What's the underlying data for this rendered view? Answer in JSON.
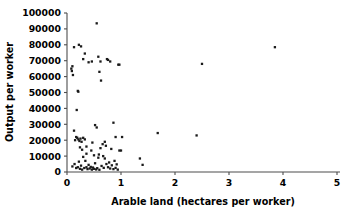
{
  "chart_data": {
    "type": "scatter",
    "title": "",
    "xlabel": "Arable land (hectares per worker)",
    "ylabel": "Output per worker",
    "xlim": [
      0,
      5
    ],
    "ylim": [
      0,
      100000
    ],
    "grid": false,
    "legend": null,
    "xticks": [
      "0",
      "1",
      "2",
      "3",
      "4",
      "5"
    ],
    "xtick_values": [
      0,
      1,
      2,
      3,
      4,
      5
    ],
    "yticks": [
      "0",
      "10000",
      "20000",
      "30000",
      "40000",
      "50000",
      "60000",
      "70000",
      "80000",
      "90000",
      "100000"
    ],
    "ytick_values": [
      0,
      10000,
      20000,
      30000,
      40000,
      50000,
      60000,
      70000,
      80000,
      90000,
      100000
    ],
    "marker": "square",
    "marker_color": "#1a1a1a",
    "points": [
      [
        0.08,
        65000
      ],
      [
        0.09,
        63500
      ],
      [
        0.1,
        66500
      ],
      [
        0.11,
        61000
      ],
      [
        0.13,
        78500
      ],
      [
        0.22,
        80000
      ],
      [
        0.26,
        79000
      ],
      [
        0.2,
        51000
      ],
      [
        0.21,
        50500
      ],
      [
        0.33,
        74500
      ],
      [
        0.4,
        69000
      ],
      [
        0.46,
        69500
      ],
      [
        0.3,
        71000
      ],
      [
        0.55,
        93500
      ],
      [
        0.58,
        72500
      ],
      [
        0.62,
        69500
      ],
      [
        0.6,
        63000
      ],
      [
        0.63,
        57500
      ],
      [
        0.76,
        70500
      ],
      [
        0.8,
        69500
      ],
      [
        0.74,
        71000
      ],
      [
        0.95,
        67500
      ],
      [
        0.97,
        67500
      ],
      [
        0.18,
        39000
      ],
      [
        0.52,
        29500
      ],
      [
        0.55,
        28000
      ],
      [
        0.86,
        31000
      ],
      [
        0.13,
        26000
      ],
      [
        0.17,
        22000
      ],
      [
        0.19,
        21500
      ],
      [
        0.15,
        20000
      ],
      [
        0.21,
        20500
      ],
      [
        0.23,
        19500
      ],
      [
        0.25,
        21000
      ],
      [
        0.27,
        19000
      ],
      [
        0.3,
        21500
      ],
      [
        0.33,
        20500
      ],
      [
        0.36,
        16000
      ],
      [
        0.24,
        15500
      ],
      [
        0.28,
        14000
      ],
      [
        0.45,
        13500
      ],
      [
        0.47,
        18500
      ],
      [
        0.62,
        15000
      ],
      [
        0.66,
        17500
      ],
      [
        0.7,
        19000
      ],
      [
        0.72,
        16500
      ],
      [
        0.82,
        14500
      ],
      [
        0.9,
        22000
      ],
      [
        0.97,
        13500
      ],
      [
        0.1,
        3500
      ],
      [
        0.14,
        5000
      ],
      [
        0.17,
        2500
      ],
      [
        0.2,
        3000
      ],
      [
        0.22,
        6500
      ],
      [
        0.24,
        2000
      ],
      [
        0.26,
        4000
      ],
      [
        0.28,
        1500
      ],
      [
        0.3,
        9500
      ],
      [
        0.32,
        2500
      ],
      [
        0.34,
        7000
      ],
      [
        0.36,
        3000
      ],
      [
        0.38,
        1800
      ],
      [
        0.4,
        4500
      ],
      [
        0.42,
        2200
      ],
      [
        0.44,
        3200
      ],
      [
        0.46,
        1500
      ],
      [
        0.48,
        2800
      ],
      [
        0.5,
        2000
      ],
      [
        0.52,
        5500
      ],
      [
        0.54,
        1600
      ],
      [
        0.56,
        2400
      ],
      [
        0.58,
        9000
      ],
      [
        0.6,
        1400
      ],
      [
        0.64,
        3800
      ],
      [
        0.68,
        2600
      ],
      [
        0.7,
        8500
      ],
      [
        0.73,
        5000
      ],
      [
        0.76,
        3000
      ],
      [
        0.78,
        6000
      ],
      [
        0.8,
        2200
      ],
      [
        0.83,
        4200
      ],
      [
        0.86,
        1800
      ],
      [
        0.88,
        7000
      ],
      [
        0.9,
        2600
      ],
      [
        0.92,
        4800
      ],
      [
        0.94,
        1500
      ],
      [
        0.36,
        11500
      ],
      [
        0.5,
        10500
      ],
      [
        0.59,
        11000
      ],
      [
        0.67,
        10000
      ],
      [
        1.02,
        22000
      ],
      [
        1.0,
        13500
      ],
      [
        1.35,
        8500
      ],
      [
        1.4,
        4500
      ],
      [
        1.68,
        24500
      ],
      [
        2.4,
        23000
      ],
      [
        2.5,
        68000
      ],
      [
        3.85,
        78500
      ]
    ]
  },
  "axes": {
    "x_label_text": "Arable land (hectares per worker)",
    "y_label_text": "Output per worker"
  }
}
